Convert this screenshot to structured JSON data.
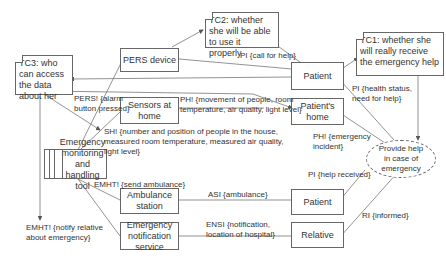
{
  "nodes": {
    "pers_device": "PERS device",
    "sensors_at_home": "Sensors at home",
    "patient_top": "Patient",
    "patients_home": "Patient's home",
    "emht_tool": "Emergency monitoring and handling tool",
    "ambulance_station": "Ambulance station",
    "emergency_notification_service": "Emergency notification service",
    "patient_bottom": "Patient",
    "relative": "Relative",
    "goal_ellipse": "Provide help in case of emergency"
  },
  "notes": {
    "tc1": "TC1: whether she will really receive the emergency help",
    "tc2": "TC2: whether she will be able to use it properly",
    "tc3": "TC3: who can access the data about her"
  },
  "edge_labels": {
    "pi_call_for_help": "PI {call for help}",
    "pers_alarm": "PERS! {alarm button pressed}",
    "ph_movement": "PH! {movement of people, room temperature, air quality, light level}",
    "sh_number": "SH! {number and position of people in the house, measured room temperature, measured air quality, light level}",
    "pi_health": "PI {health status, need for help}",
    "ph_emergency": "PH! {emergency incident}",
    "emht_send_ambulance": "EMHT! {send ambulance}",
    "pi_help_received": "PI {help received}",
    "as_ambulance": "ASI {ambulance}",
    "ens_notification": "ENSI {notification, location of hospital}",
    "ri_informed": "RI {informed}",
    "emht_notify_relative": "EMHT! {notify relative about emergency}"
  }
}
